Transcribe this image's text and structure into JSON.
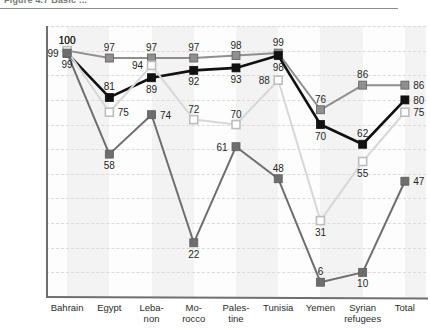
{
  "figure": {
    "caption": "Figure 4.7  Basic ..."
  },
  "axes": {
    "y_ticks": [
      0,
      10,
      20,
      30,
      40,
      50,
      60,
      70,
      80,
      90,
      100,
      110
    ],
    "y_min": 0,
    "y_max": 110,
    "x_labels": [
      "Bahrain",
      "Egypt",
      "Leba-\nnon",
      "Mo-\nrocco",
      "Pales-\ntine",
      "Tunisia",
      "Yemen",
      "Syrian\nrefugees",
      "Total"
    ]
  },
  "colors": {
    "series_medium_gray": "#8f8f8f",
    "series_black": "#111111",
    "series_light_gray": "#d7d7d7",
    "series_dark_gray": "#6e6e6e",
    "gridline": "#e3d5d8",
    "axis": "#6f6f73",
    "band": "#f4f3f4",
    "plot_bg": "#fdfdfd"
  },
  "chart_data": {
    "type": "line",
    "title": "Figure 4.7  Basic ...",
    "xlabel": "",
    "ylabel": "",
    "ylim": [
      0,
      110
    ],
    "grid": true,
    "legend": "none",
    "categories": [
      "Bahrain",
      "Egypt",
      "Lebanon",
      "Morocco",
      "Palestine",
      "Tunisia",
      "Yemen",
      "Syrian refugees",
      "Total"
    ],
    "series": [
      {
        "name": "series-medium-gray",
        "color": "#8f8f8f",
        "marker": "filled-square",
        "values": [
          100,
          97,
          97,
          97,
          98,
          99,
          76,
          86,
          86
        ],
        "label_positions": [
          "above",
          "above",
          "above",
          "above",
          "above",
          "above",
          "above",
          "above",
          "right"
        ]
      },
      {
        "name": "series-black",
        "color": "#111111",
        "marker": "filled-square",
        "values": [
          99,
          81,
          89,
          92,
          93,
          98,
          70,
          62,
          80
        ],
        "label_positions": [
          "left",
          "above",
          "below",
          "below",
          "below",
          "below",
          "below",
          "above",
          "right"
        ]
      },
      {
        "name": "series-light-gray",
        "color": "#d7d7d7",
        "marker": "outline-square",
        "values": [
          100,
          75,
          94,
          72,
          70,
          88,
          31,
          55,
          75
        ],
        "label_positions": [
          "above",
          "right",
          "left",
          "above",
          "above",
          "left",
          "below",
          "below",
          "right"
        ]
      },
      {
        "name": "series-dark-gray",
        "color": "#6e6e6e",
        "marker": "filled-square",
        "values": [
          99,
          58,
          74,
          22,
          61,
          48,
          6,
          10,
          47
        ],
        "label_positions": [
          "below",
          "below",
          "right",
          "below",
          "left",
          "above",
          "above",
          "below",
          "right"
        ]
      }
    ]
  }
}
